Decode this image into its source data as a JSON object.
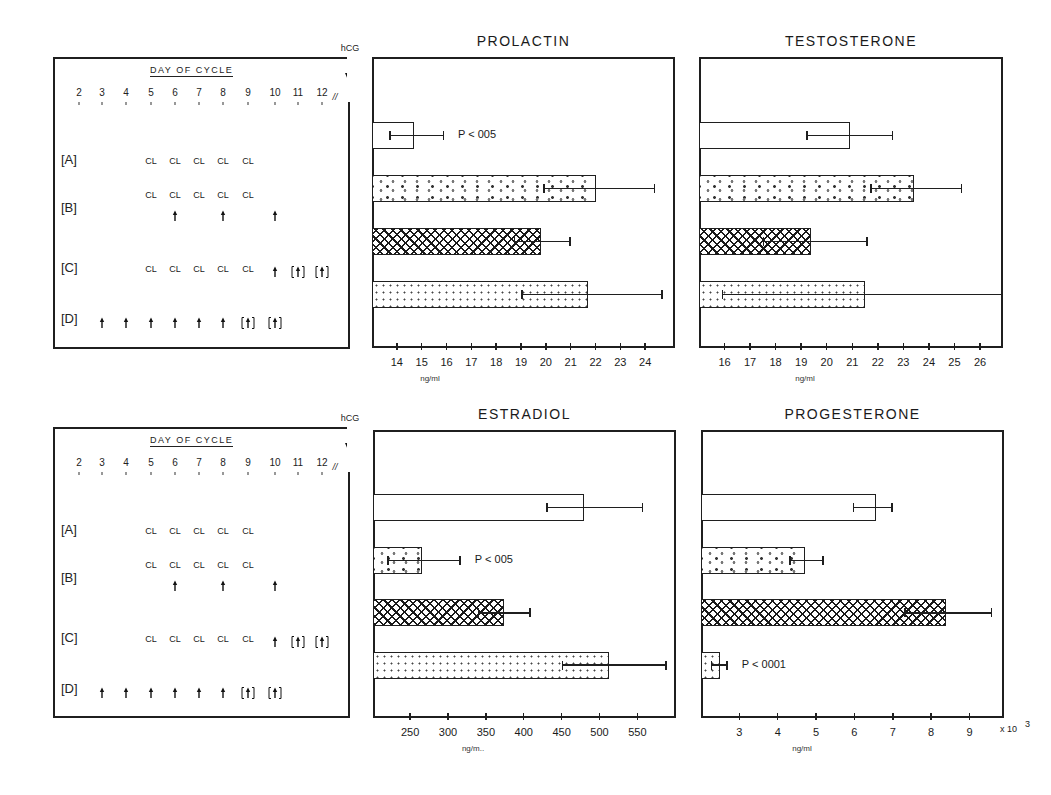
{
  "figure": {
    "schedule": {
      "heading": "DAY OF CYCLE",
      "hcg_label": "hCG",
      "break_mark": "//",
      "days": [
        "2",
        "3",
        "4",
        "5",
        "6",
        "7",
        "8",
        "9",
        "10",
        "11",
        "12"
      ],
      "groups": [
        {
          "label": "[A]",
          "cl_days": [
            "5",
            "6",
            "7",
            "8",
            "9"
          ],
          "arrow_days": [],
          "bracket_arrow_days": []
        },
        {
          "label": "[B]",
          "cl_days": [
            "5",
            "6",
            "7",
            "8",
            "9"
          ],
          "arrow_days": [
            "6",
            "8",
            "10"
          ],
          "bracket_arrow_days": []
        },
        {
          "label": "[C]",
          "cl_days": [
            "5",
            "6",
            "7",
            "8",
            "9"
          ],
          "arrow_days": [
            "10"
          ],
          "bracket_arrow_days": [
            "11",
            "12"
          ]
        },
        {
          "label": "[D]",
          "cl_days": [],
          "arrow_days": [
            "3",
            "4",
            "5",
            "6",
            "7",
            "8"
          ],
          "bracket_arrow_days": [
            "9",
            "10"
          ]
        }
      ],
      "cl_symbol": "CL",
      "legend_note": "CL = clomiphene; ↑ = hMG injection; [↑] = optional injection"
    }
  },
  "chart_data": [
    {
      "type": "bar",
      "orientation": "horizontal",
      "title": "PROLACTIN",
      "xlabel": "ng/ml",
      "categories": [
        "A",
        "B",
        "C",
        "D"
      ],
      "values": [
        14.7,
        22.0,
        19.8,
        21.7
      ],
      "error_low": [
        13.7,
        19.9,
        18.7,
        19.0
      ],
      "error_high": [
        15.9,
        24.4,
        21.0,
        24.7
      ],
      "patterns": [
        "open",
        "circles",
        "crosshatch",
        "dots"
      ],
      "xticks": [
        "14",
        "15",
        "16",
        "17",
        "18",
        "19",
        "20",
        "21",
        "22",
        "23",
        "24"
      ],
      "xlim": [
        13.0,
        25.2
      ],
      "annotations": [
        {
          "category": "A",
          "text": "P < 005"
        }
      ]
    },
    {
      "type": "bar",
      "orientation": "horizontal",
      "title": "TESTOSTERONE",
      "xlabel": "ng/ml",
      "categories": [
        "A",
        "B",
        "C",
        "D"
      ],
      "values": [
        20.9,
        23.4,
        19.4,
        21.5
      ],
      "error_low": [
        19.2,
        21.7,
        17.5,
        15.9
      ],
      "error_high": [
        22.6,
        25.3,
        21.6,
        27.0
      ],
      "patterns": [
        "open",
        "circles",
        "crosshatch",
        "dots"
      ],
      "xticks": [
        "16",
        "17",
        "18",
        "19",
        "20",
        "21",
        "22",
        "23",
        "24",
        "25",
        "26"
      ],
      "xlim": [
        15.0,
        26.9
      ],
      "annotations": []
    },
    {
      "type": "bar",
      "orientation": "horizontal",
      "title": "ESTRADIOL",
      "xlabel": "ng/m..",
      "categories": [
        "A",
        "B",
        "C",
        "D"
      ],
      "values": [
        479,
        266,
        374,
        513
      ],
      "error_low": [
        430,
        220,
        339,
        450
      ],
      "error_high": [
        558,
        317,
        409,
        589
      ],
      "patterns": [
        "open",
        "circles",
        "crosshatch",
        "dots"
      ],
      "xticks": [
        "250",
        "300",
        "350",
        "400",
        "450",
        "500",
        "550"
      ],
      "xlim": [
        201,
        601
      ],
      "annotations": [
        {
          "category": "B",
          "text": "P < 005"
        }
      ]
    },
    {
      "type": "bar",
      "orientation": "horizontal",
      "title": "PROGESTERONE",
      "xlabel": "ng/ml",
      "x_multiplier": "x 10³",
      "categories": [
        "A",
        "B",
        "C",
        "D"
      ],
      "values": [
        6.55,
        4.7,
        8.4,
        2.5
      ],
      "error_low": [
        5.95,
        4.3,
        7.3,
        2.25
      ],
      "error_high": [
        7.0,
        5.2,
        9.6,
        2.7
      ],
      "patterns": [
        "open",
        "circles",
        "crosshatch",
        "dots"
      ],
      "xticks": [
        "3",
        "4",
        "5",
        "6",
        "7",
        "8",
        "9"
      ],
      "xlim": [
        2.0,
        9.9
      ],
      "annotations": [
        {
          "category": "D",
          "text": "P < 0001"
        }
      ]
    }
  ],
  "labels": {
    "prolactin_title": "PROLACTIN",
    "testosterone_title": "TESTOSTERONE",
    "estradiol_title": "ESTRADIOL",
    "progesterone_title": "PROGESTERONE",
    "unit_ngml": "ng/ml",
    "unit_estradiol": "ng/m..",
    "x10_3": "x 10",
    "x10_exp": "3"
  }
}
